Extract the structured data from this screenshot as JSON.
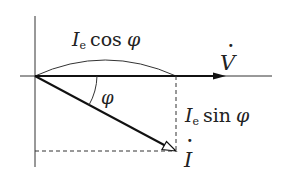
{
  "diagram": {
    "type": "phasor-diagram",
    "colors": {
      "line": "#222222",
      "background": "#ffffff",
      "text": "#222222"
    },
    "labels": {
      "cos_component": {
        "symbol": "I",
        "subscript": "e",
        "func": "cos",
        "angle": "φ"
      },
      "sin_component": {
        "symbol": "I",
        "subscript": "e",
        "func": "sin",
        "angle": "φ"
      },
      "voltage_phasor": {
        "symbol": "V",
        "dot": "·"
      },
      "current_phasor": {
        "symbol": "I",
        "dot": "·"
      },
      "angle": "φ"
    },
    "elements": {
      "origin": [
        35,
        76
      ],
      "horizontal_axis": {
        "from": [
          20,
          76
        ],
        "to": [
          272,
          76
        ]
      },
      "vertical_axis": {
        "from": [
          35,
          16
        ],
        "to": [
          35,
          167
        ]
      },
      "voltage_arrow": {
        "from": [
          35,
          76
        ],
        "to": [
          225,
          76
        ],
        "head": "filled"
      },
      "current_arrow": {
        "from": [
          35,
          76
        ],
        "to": [
          176,
          151
        ],
        "head": "open"
      },
      "projection_vertical": {
        "from": [
          176,
          76
        ],
        "to": [
          176,
          151
        ],
        "style": "dashed"
      },
      "projection_horizontal": {
        "from": [
          35,
          151
        ],
        "to": [
          176,
          151
        ],
        "style": "dashed"
      },
      "cos_brace_arc": {
        "from": [
          35,
          76
        ],
        "to": [
          176,
          76
        ],
        "peak_y": 60
      }
    }
  }
}
